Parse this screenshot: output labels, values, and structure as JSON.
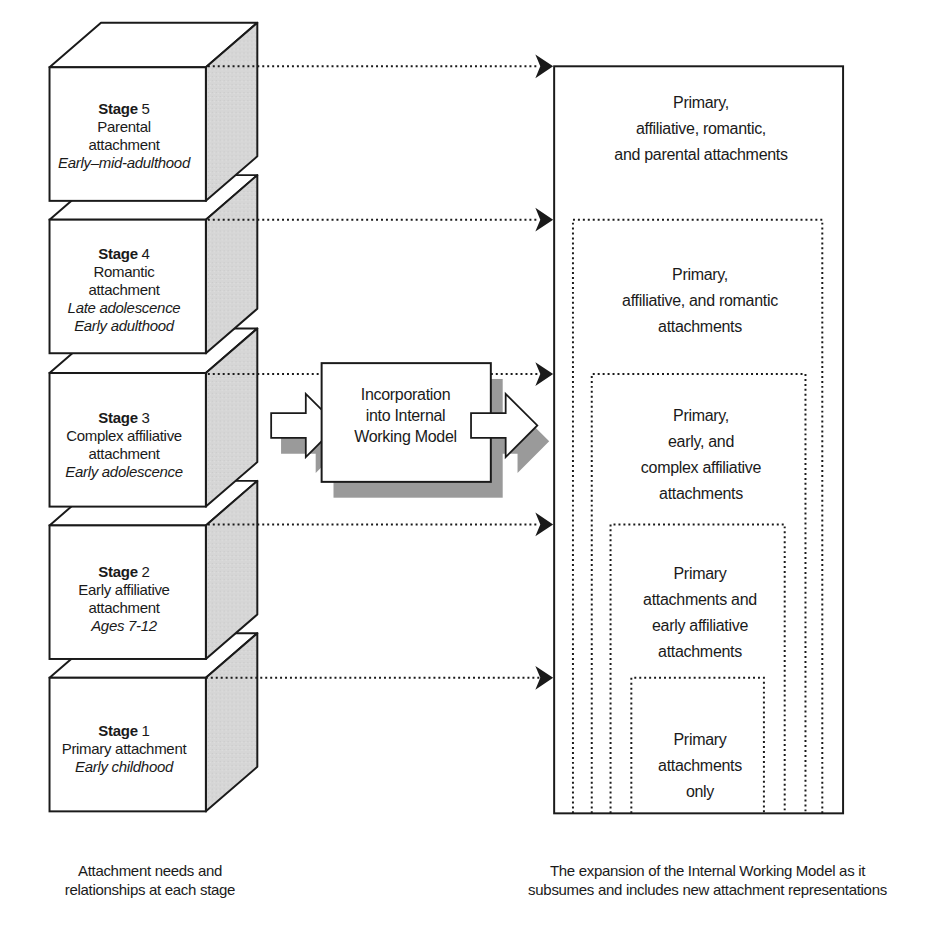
{
  "stages": [
    {
      "label": "Stage",
      "num": "5",
      "lines": [
        "Parental",
        "attachment"
      ],
      "period": [
        "Early–mid-adulthood"
      ],
      "front_top": 68
    },
    {
      "label": "Stage",
      "num": "4",
      "lines": [
        "Romantic",
        "attachment"
      ],
      "period": [
        "Late adolescence",
        "Early adulthood"
      ],
      "front_top": 222
    },
    {
      "label": "Stage",
      "num": "3",
      "lines": [
        "Complex affiliative",
        "attachment"
      ],
      "period": [
        "Early adolescence"
      ],
      "front_top": 377
    },
    {
      "label": "Stage",
      "num": "2",
      "lines": [
        "Early affiliative",
        "attachment"
      ],
      "period": [
        "Ages 7-12"
      ],
      "front_top": 531
    },
    {
      "label": "Stage",
      "num": "1",
      "lines": [
        "Primary attachment"
      ],
      "period": [
        "Early childhood"
      ],
      "front_top": 685
    }
  ],
  "center_box": {
    "lines": [
      "Incorporation",
      "into Internal",
      "Working Model"
    ]
  },
  "iwm_boxes": [
    {
      "lines": [
        "Primary,",
        "affiliative, romantic,",
        "and parental attachments"
      ],
      "style": "solid",
      "x": 555,
      "y": 67,
      "w": 292,
      "text_top": 90
    },
    {
      "lines": [
        "Primary,",
        "affiliative, and romantic",
        "attachments"
      ],
      "style": "dotted",
      "x": 574,
      "y": 222,
      "w": 252,
      "text_top": 262
    },
    {
      "lines": [
        "Primary,",
        "early, and",
        "complex affiliative",
        "attachments"
      ],
      "style": "dotted",
      "x": 593,
      "y": 378,
      "w": 216,
      "text_top": 403
    },
    {
      "lines": [
        "Primary",
        "attachments and",
        "early affiliative",
        "attachments"
      ],
      "style": "dotted",
      "x": 612,
      "y": 530,
      "w": 176,
      "text_top": 561
    },
    {
      "lines": [
        "Primary",
        "attachments",
        "only"
      ],
      "style": "dotted",
      "x": 633,
      "y": 685,
      "w": 134,
      "text_top": 727
    }
  ],
  "captions": {
    "left": [
      "Attachment needs and",
      "relationships at each stage"
    ],
    "right": [
      "The expansion of the Internal Working Model as it",
      "subsumes and includes  new attachment representations"
    ]
  },
  "colors": {
    "stroke": "#1a1a1a",
    "cube_side": "#d4d4d4",
    "shadow": "#9a9a9a",
    "background": "#ffffff"
  }
}
